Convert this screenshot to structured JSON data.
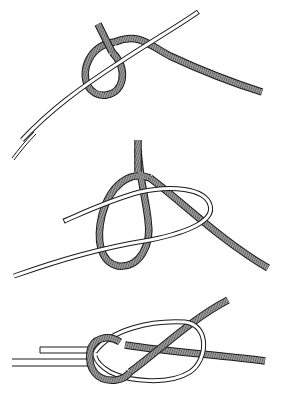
{
  "figure": {
    "title": "Figure-eight (Flemish) bend tying sequence",
    "steps": [
      {
        "id": 1,
        "label": "Step 1: loop formed in hatched rope around plain rope"
      },
      {
        "id": 2,
        "label": "Step 2: plain rope end threaded through loop"
      },
      {
        "id": 3,
        "label": "Step 3: finished knot, ends pulled tight"
      }
    ],
    "colors": {
      "background": "#ffffff",
      "outline": "#1a1a1a",
      "plain_rope_fill": "#ffffff",
      "hatched_rope_fill": "#8a8a8a"
    }
  }
}
